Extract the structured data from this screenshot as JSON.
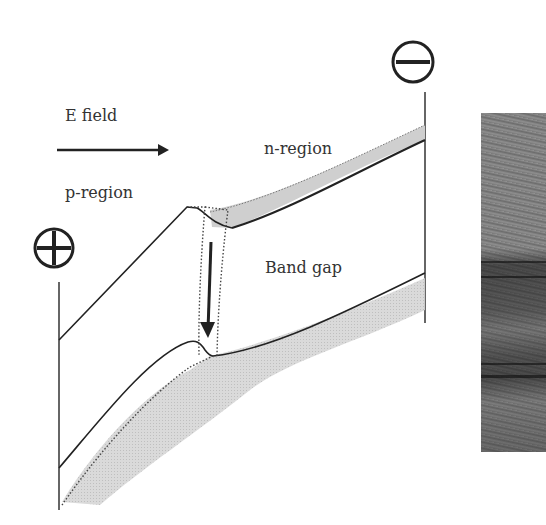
{
  "labels": {
    "e_field": "E field",
    "p_region": "p-region",
    "n_region": "n-region",
    "band_gap": "Band gap"
  },
  "symbols": {
    "positive_terminal": "plus-in-circle",
    "negative_terminal": "minus-in-circle"
  },
  "arrows": {
    "e_field_direction": "right",
    "electron_transition_direction": "down"
  },
  "colors": {
    "line": "#222222",
    "band_fill": "#cfcfcf",
    "text": "#333333",
    "background": "#ffffff"
  },
  "photo": {
    "description": "grayscale photograph of layered rock/sediment outcrop"
  }
}
